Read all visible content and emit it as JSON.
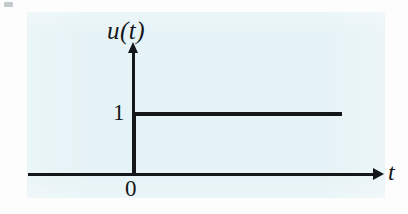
{
  "figure": {
    "kind": "unit-step-function-plot",
    "paper_tint_color": "#e6f3f6",
    "ink_color": "#14171a"
  },
  "labels": {
    "y_axis_label": "u(t)",
    "x_axis_label": "t",
    "amplitude_tick": "1",
    "origin_tick": "0"
  },
  "chart_data": {
    "type": "line",
    "title": "",
    "subtitle": "",
    "xlabel": "t",
    "ylabel": "u(t)",
    "xlim": [
      -1.1,
      3.0
    ],
    "ylim": [
      0,
      1.45
    ],
    "grid": false,
    "legend": null,
    "xticks": [
      0
    ],
    "xtick_labels": [
      "0"
    ],
    "yticks": [
      1
    ],
    "ytick_labels": [
      "1"
    ],
    "series": [
      {
        "name": "u(t)",
        "x": [
          -1.1,
          0,
          0,
          2.35
        ],
        "y": [
          0,
          0,
          1,
          1
        ]
      }
    ],
    "annotations": [
      {
        "text": "u(t)",
        "x": 0,
        "y": 1.42
      },
      {
        "text": "t",
        "x": 2.95,
        "y": 0.08
      },
      {
        "text": "1",
        "x": -0.14,
        "y": 1.0
      },
      {
        "text": "0",
        "x": -0.06,
        "y": -0.12
      }
    ]
  }
}
